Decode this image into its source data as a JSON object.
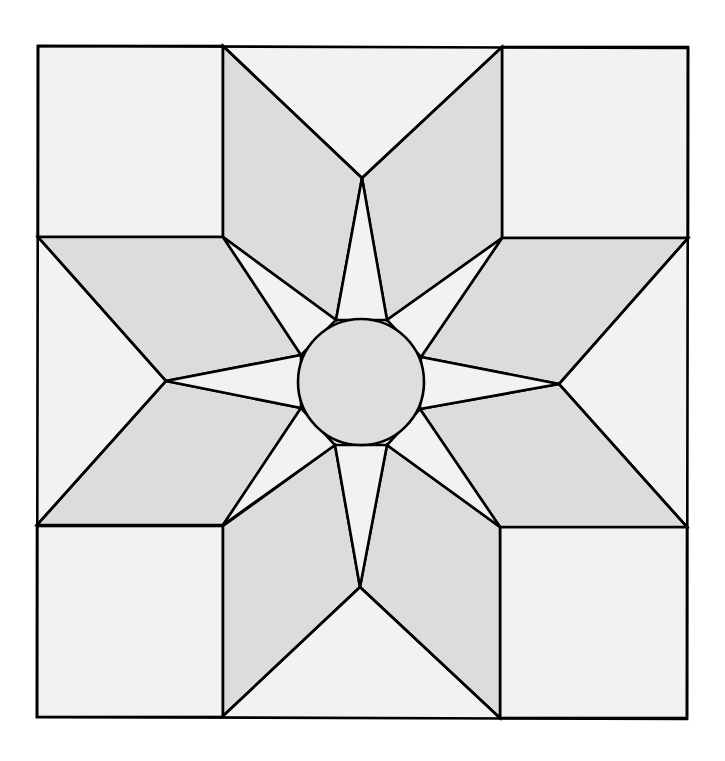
{
  "diagram": {
    "type": "quilt-block",
    "colors": {
      "background": "#ffffff",
      "light_fabric": "#f2f2f2",
      "rhombus_fabric": "#dcdcdc",
      "circle_fabric": "#dedede",
      "outline": "#000000"
    },
    "outer_square": {
      "x1": 38,
      "y1": 46,
      "x2": 688,
      "y2": 718
    },
    "grid": {
      "x_lines": [
        223,
        502
      ],
      "y_lines": [
        237,
        526
      ]
    },
    "center_circle": {
      "cx": 361,
      "cy": 382,
      "r": 63
    },
    "pieces": {
      "corner_squares": 4,
      "side_triangles": 4,
      "rhombus_points": 8,
      "star_spike_triangles": 8,
      "center_circle": 1
    }
  }
}
